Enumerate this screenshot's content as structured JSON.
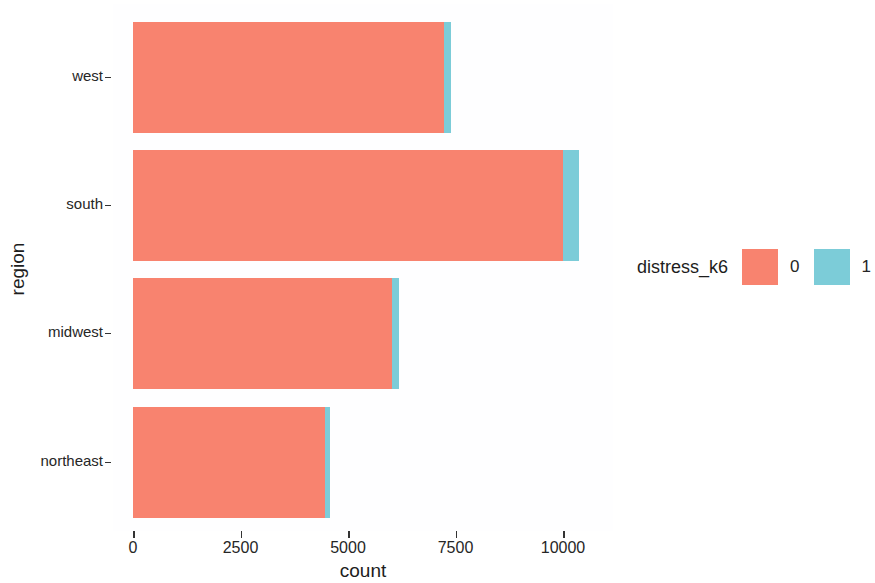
{
  "chart_data": {
    "type": "bar",
    "orientation": "horizontal",
    "stacked": true,
    "title": "",
    "xlabel": "count",
    "ylabel": "region",
    "categories": [
      "west",
      "south",
      "midwest",
      "northeast"
    ],
    "category_order_top_to_bottom": [
      "west",
      "south",
      "midwest",
      "northeast"
    ],
    "x_ticks": [
      0,
      2500,
      5000,
      7500,
      10000
    ],
    "x_tick_labels": [
      "0",
      "2500",
      "5000",
      "7500",
      "10000"
    ],
    "xlim": [
      0,
      11600
    ],
    "grid": false,
    "legend": {
      "title": "distress_k6",
      "position": "right",
      "entries": [
        {
          "label": "0",
          "color": "#F8836F"
        },
        {
          "label": "1",
          "color": "#7CCCD8"
        }
      ]
    },
    "series": [
      {
        "name": "0",
        "color": "#F8836F",
        "values": [
          7230,
          10000,
          6020,
          4470
        ]
      },
      {
        "name": "1",
        "color": "#7CCCD8",
        "values": [
          170,
          370,
          160,
          110
        ]
      }
    ],
    "totals": [
      7400,
      10370,
      6180,
      4580
    ]
  },
  "axis": {
    "y_title": "region",
    "x_title": "count"
  },
  "colors": {
    "level_0": "#F8836F",
    "level_1": "#7CCCD8",
    "panel_background": "#FEFEFF",
    "axis_text": "#262626",
    "axis_title": "#1D1D1D"
  }
}
